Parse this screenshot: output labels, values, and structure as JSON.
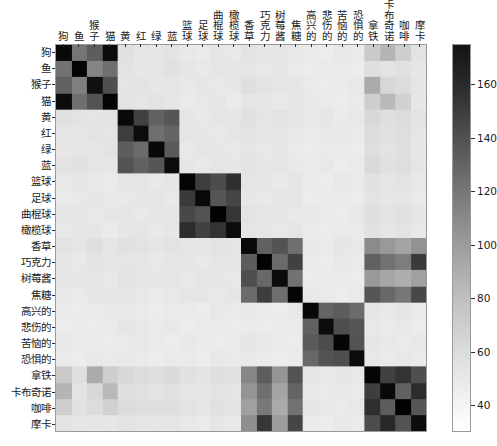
{
  "chart_data": {
    "type": "heatmap",
    "title": "",
    "xlabel": "",
    "ylabel": "",
    "colormap": "gray_r",
    "grid": false,
    "legend_position": "right-colorbar",
    "colorbar": {
      "label": "",
      "vmin": 30,
      "vmax": 175,
      "ticks": [
        40,
        60,
        80,
        100,
        120,
        140,
        160
      ],
      "tick_labels": [
        "40",
        "60",
        "80",
        "100",
        "120",
        "140",
        "160"
      ],
      "orientation": "vertical"
    },
    "categories": [
      "狗",
      "鱼",
      "猴子",
      "猫",
      "黄",
      "红",
      "绿",
      "蓝",
      "篮球",
      "足球",
      "曲棍球",
      "橄榄球",
      "香草",
      "巧克力",
      "树莓酱",
      "焦糖",
      "高兴的",
      "悲伤的",
      "苦恼的",
      "恐惧的",
      "拿铁",
      "卡布奇诺",
      "咖啡",
      "摩卡"
    ],
    "x_tick_labels": [
      "狗",
      "鱼",
      "猴子",
      "猫",
      "黄",
      "红",
      "绿",
      "蓝",
      "篮球",
      "足球",
      "曲棍球",
      "橄榄球",
      "香草",
      "巧克力",
      "树莓酱",
      "焦糖",
      "高兴的",
      "悲伤的",
      "苦恼的",
      "恐惧的",
      "拿铁",
      "卡布奇诺",
      "咖啡",
      "摩卡"
    ],
    "y_tick_labels": [
      "狗",
      "鱼",
      "猴子",
      "猫",
      "黄",
      "红",
      "绿",
      "蓝",
      "篮球",
      "足球",
      "曲棍球",
      "橄榄球",
      "香草",
      "巧克力",
      "树莓酱",
      "焦糖",
      "高兴的",
      "悲伤的",
      "苦恼的",
      "恐惧的",
      "拿铁",
      "卡布奇诺",
      "咖啡",
      "摩卡"
    ],
    "n_rows": 22,
    "n_cols": 22,
    "row_labels": [
      "狗",
      "鱼",
      "猴子",
      "猫",
      "黄",
      "红",
      "绿",
      "蓝",
      "篮球",
      "足球",
      "曲棍球",
      "橄榄球",
      "香草",
      "巧克力",
      "树莓酱",
      "焦糖",
      "高兴的",
      "悲伤的",
      "苦恼的",
      "恐惧的",
      "拿铁",
      "咖啡"
    ],
    "col_labels": [
      "狗",
      "鱼",
      "猴子",
      "猫",
      "黄",
      "红",
      "绿",
      "蓝",
      "篮球",
      "足球",
      "曲棍球",
      "橄榄球",
      "香草",
      "巧克力",
      "树莓酱",
      "焦糖",
      "高兴的",
      "悲伤的",
      "苦恼的",
      "恐惧的",
      "拿铁",
      "咖啡"
    ],
    "values": [
      [
        170,
        108,
        122,
        168,
        47,
        45,
        44,
        46,
        43,
        42,
        44,
        43,
        46,
        44,
        45,
        43,
        42,
        41,
        43,
        42,
        60,
        72,
        58,
        46
      ],
      [
        110,
        172,
        100,
        112,
        46,
        44,
        45,
        47,
        44,
        43,
        45,
        44,
        45,
        43,
        44,
        42,
        41,
        42,
        42,
        41,
        48,
        46,
        47,
        44
      ],
      [
        120,
        102,
        166,
        130,
        45,
        46,
        44,
        45,
        43,
        44,
        43,
        44,
        48,
        46,
        45,
        44,
        42,
        41,
        42,
        43,
        78,
        52,
        50,
        45
      ],
      [
        168,
        112,
        128,
        173,
        46,
        45,
        46,
        44,
        42,
        43,
        44,
        42,
        45,
        44,
        43,
        45,
        43,
        42,
        41,
        42,
        58,
        70,
        56,
        44
      ],
      [
        47,
        46,
        45,
        46,
        170,
        138,
        120,
        126,
        44,
        43,
        45,
        44,
        47,
        45,
        46,
        44,
        43,
        44,
        42,
        43,
        52,
        48,
        50,
        46
      ],
      [
        45,
        44,
        46,
        45,
        140,
        168,
        112,
        118,
        45,
        44,
        43,
        45,
        46,
        44,
        45,
        43,
        42,
        43,
        43,
        42,
        50,
        47,
        49,
        45
      ],
      [
        44,
        45,
        44,
        46,
        122,
        114,
        171,
        124,
        43,
        45,
        44,
        43,
        45,
        43,
        44,
        42,
        41,
        42,
        42,
        41,
        49,
        46,
        48,
        44
      ],
      [
        46,
        47,
        45,
        44,
        128,
        120,
        126,
        169,
        44,
        43,
        45,
        44,
        46,
        44,
        45,
        43,
        42,
        43,
        41,
        42,
        51,
        47,
        49,
        45
      ],
      [
        43,
        44,
        43,
        42,
        44,
        45,
        43,
        44,
        172,
        140,
        132,
        148,
        45,
        44,
        43,
        45,
        42,
        41,
        43,
        42,
        47,
        45,
        46,
        43
      ],
      [
        42,
        43,
        44,
        43,
        43,
        44,
        45,
        43,
        142,
        170,
        126,
        136,
        44,
        43,
        45,
        44,
        41,
        42,
        42,
        41,
        46,
        44,
        45,
        42
      ],
      [
        44,
        45,
        43,
        44,
        45,
        43,
        44,
        45,
        134,
        128,
        174,
        144,
        46,
        45,
        44,
        43,
        43,
        42,
        41,
        43,
        48,
        46,
        47,
        44
      ],
      [
        43,
        44,
        44,
        42,
        44,
        45,
        43,
        44,
        150,
        138,
        146,
        168,
        45,
        44,
        43,
        45,
        42,
        41,
        42,
        42,
        47,
        45,
        46,
        43
      ],
      [
        46,
        45,
        48,
        45,
        47,
        46,
        45,
        46,
        45,
        44,
        46,
        45,
        170,
        120,
        128,
        112,
        43,
        42,
        44,
        43,
        96,
        88,
        82,
        92
      ],
      [
        44,
        43,
        46,
        44,
        45,
        44,
        43,
        44,
        44,
        43,
        45,
        44,
        122,
        174,
        114,
        138,
        42,
        41,
        43,
        42,
        120,
        110,
        104,
        142
      ],
      [
        45,
        44,
        45,
        43,
        46,
        45,
        44,
        45,
        43,
        45,
        44,
        43,
        130,
        116,
        168,
        110,
        41,
        42,
        42,
        41,
        88,
        80,
        76,
        84
      ],
      [
        43,
        42,
        44,
        45,
        44,
        43,
        42,
        43,
        45,
        44,
        43,
        45,
        114,
        140,
        112,
        172,
        43,
        42,
        41,
        42,
        126,
        116,
        108,
        134
      ],
      [
        42,
        41,
        42,
        43,
        43,
        42,
        41,
        42,
        42,
        41,
        43,
        42,
        43,
        42,
        41,
        43,
        170,
        118,
        122,
        114,
        44,
        43,
        44,
        42
      ],
      [
        41,
        42,
        41,
        42,
        44,
        43,
        42,
        43,
        41,
        42,
        42,
        41,
        42,
        41,
        42,
        42,
        120,
        168,
        130,
        126,
        43,
        42,
        43,
        41
      ],
      [
        43,
        42,
        42,
        41,
        42,
        43,
        42,
        41,
        43,
        42,
        41,
        42,
        44,
        43,
        42,
        41,
        124,
        132,
        172,
        128,
        44,
        43,
        42,
        43
      ],
      [
        42,
        41,
        43,
        42,
        43,
        42,
        41,
        42,
        42,
        41,
        43,
        42,
        43,
        42,
        41,
        42,
        116,
        128,
        130,
        169,
        43,
        42,
        43,
        42
      ],
      [
        60,
        48,
        78,
        58,
        52,
        50,
        49,
        51,
        47,
        46,
        48,
        47,
        98,
        122,
        90,
        128,
        44,
        43,
        44,
        43,
        172,
        138,
        146,
        130
      ],
      [
        72,
        46,
        52,
        70,
        48,
        47,
        46,
        47,
        45,
        44,
        46,
        45,
        90,
        112,
        82,
        118,
        43,
        42,
        43,
        42,
        140,
        170,
        120,
        150
      ],
      [
        58,
        47,
        50,
        56,
        50,
        49,
        48,
        49,
        46,
        45,
        47,
        46,
        84,
        106,
        78,
        110,
        44,
        43,
        42,
        43,
        148,
        122,
        174,
        126
      ],
      [
        46,
        44,
        45,
        44,
        46,
        45,
        44,
        45,
        43,
        42,
        44,
        43,
        94,
        144,
        86,
        136,
        42,
        41,
        43,
        42,
        132,
        152,
        128,
        168
      ]
    ]
  },
  "colors": {
    "background": "#ffffff",
    "axis_line": "#9a9a9a",
    "tick": "#2b2b2b",
    "text": "#1a1a1a",
    "cmap_low": "#ffffff",
    "cmap_high": "#111111"
  }
}
